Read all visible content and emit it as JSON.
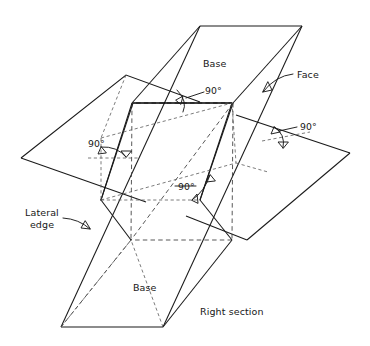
{
  "figure": {
    "labels": {
      "base_top": "Base",
      "base_bottom": "Base",
      "face": "Face",
      "lateral_edge_line1": "Lateral",
      "lateral_edge_line2": "edge",
      "right_section": "Right section",
      "angle_top": "90°",
      "angle_left": "90°",
      "angle_right": "90°",
      "angle_middle": "90°"
    },
    "colors": {
      "stroke": "#1a1a1a",
      "hidden_stroke": "#5a5a5a",
      "background": "#ffffff",
      "text": "#171717"
    },
    "geometry": {
      "top_base": [
        [
          200,
          26
        ],
        [
          302,
          26
        ],
        [
          233,
          103
        ],
        [
          132,
          103
        ]
      ],
      "bottom_base": [
        [
          61,
          327
        ],
        [
          163,
          327
        ],
        [
          232,
          240
        ],
        [
          131,
          240
        ]
      ],
      "cutting_plane": [
        [
          21,
          158
        ],
        [
          126,
          75
        ],
        [
          350,
          153
        ],
        [
          247,
          240
        ]
      ],
      "right_section": [
        [
          133,
          103
        ],
        [
          232,
          103
        ],
        [
          200,
          200
        ],
        [
          101,
          200
        ]
      ],
      "lateral_edges": [
        [
          [
            200,
            26
          ],
          [
            61,
            327
          ]
        ],
        [
          [
            302,
            26
          ],
          [
            163,
            327
          ]
        ],
        [
          [
            233,
            103
          ],
          [
            232,
            240
          ]
        ],
        [
          [
            132,
            103
          ],
          [
            131,
            240
          ]
        ]
      ]
    },
    "annotation_notes": [
      "Four 90° right-angle marks show the right section is perpendicular to the lateral edges",
      "Hidden edges drawn as dashed lines"
    ]
  }
}
